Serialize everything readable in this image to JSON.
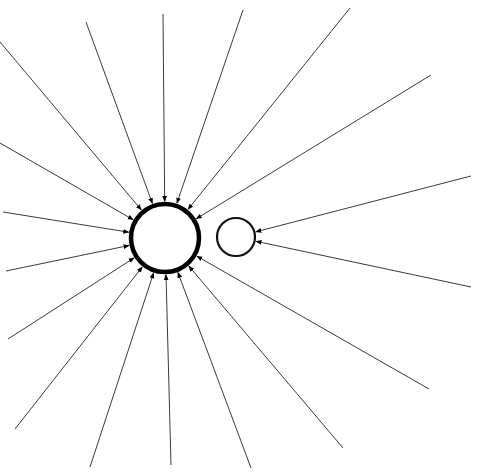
{
  "diagram": {
    "type": "star-network",
    "background": "#ffffff",
    "line_color": "#3a3a3a",
    "node_color": "#000000",
    "nodes": [
      {
        "id": "hub",
        "cx": 165,
        "cy": 238,
        "r": 34,
        "stroke_width": 4.5
      },
      {
        "id": "satellite",
        "cx": 236,
        "cy": 237,
        "r": 19,
        "stroke_width": 2.2
      }
    ],
    "edges": [
      {
        "target": "hub",
        "from": [
          0,
          42
        ]
      },
      {
        "target": "hub",
        "from": [
          86,
          22
        ]
      },
      {
        "target": "hub",
        "from": [
          163,
          14
        ]
      },
      {
        "target": "hub",
        "from": [
          243,
          10
        ]
      },
      {
        "target": "hub",
        "from": [
          350,
          8
        ]
      },
      {
        "target": "hub",
        "from": [
          431,
          75
        ]
      },
      {
        "target": "hub",
        "from": [
          0,
          143
        ]
      },
      {
        "target": "hub",
        "from": [
          3,
          212
        ]
      },
      {
        "target": "hub",
        "from": [
          6,
          271
        ]
      },
      {
        "target": "hub",
        "from": [
          8,
          339
        ]
      },
      {
        "target": "hub",
        "from": [
          15,
          429
        ]
      },
      {
        "target": "hub",
        "from": [
          90,
          467
        ]
      },
      {
        "target": "hub",
        "from": [
          171,
          465
        ]
      },
      {
        "target": "hub",
        "from": [
          251,
          468
        ]
      },
      {
        "target": "hub",
        "from": [
          343,
          448
        ]
      },
      {
        "target": "hub",
        "from": [
          429,
          389
        ]
      },
      {
        "target": "satellite",
        "from": [
          471,
          176
        ]
      },
      {
        "target": "satellite",
        "from": [
          471,
          287
        ]
      }
    ],
    "arrowheads": "on-target"
  }
}
